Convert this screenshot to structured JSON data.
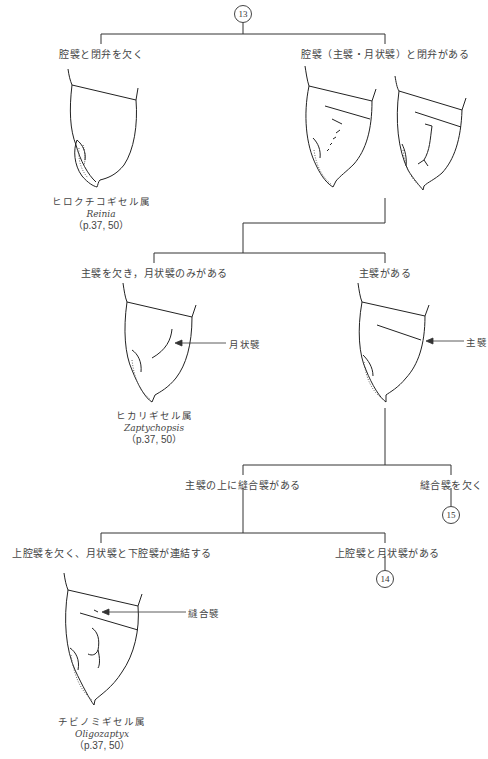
{
  "diagram": {
    "type": "dichotomous-key",
    "nodes": {
      "start": "13",
      "goto_15": "15",
      "goto_14": "14"
    },
    "couplet_13": {
      "left_label": "腔襞と閉弁を欠く",
      "right_label": "腔襞（主襞・月状襞）と閉弁がある"
    },
    "genus_reinia": {
      "jp": "ヒロクチコギセル属",
      "sci": "Reinia",
      "ref": "（p.37, 50）"
    },
    "couplet_a": {
      "left_label": "主襞を欠き，月状襞のみがある",
      "right_label": "主襞がある"
    },
    "genus_zaptychopsis": {
      "jp": "ヒカリギセル属",
      "sci": "Zaptychopsis",
      "ref": "（p.37, 50）",
      "pointer_label": "月状襞"
    },
    "main_fold_pointer": "主襞",
    "couplet_b": {
      "left_label": "主襞の上に縫合襞がある",
      "right_label": "縫合襞を欠く"
    },
    "couplet_c": {
      "left_label": "上腔襞を欠く、月状襞と下腔襞が連結する",
      "right_label": "上腔襞と月状襞がある"
    },
    "genus_oligozaptyx": {
      "jp": "チビノミギセル属",
      "sci": "Oligozaptyx",
      "ref": "（p.37, 50）",
      "pointer_label": "縫合襞"
    }
  }
}
